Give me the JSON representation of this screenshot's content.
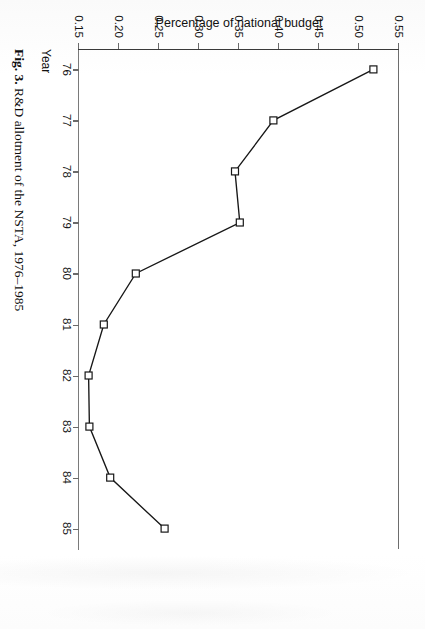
{
  "figure": {
    "caption_label": "Fig. 3.",
    "caption_text": "R&D allotment of the NSTA, 1976–1985",
    "rotation_note": "page scanned rotated 90 degrees clockwise"
  },
  "chart_data": {
    "type": "line",
    "title": "R&D allotment of the NSTA, 1976–1985",
    "xlabel": "Year",
    "ylabel": "Percentage of national budget",
    "x": [
      76,
      77,
      78,
      79,
      80,
      81,
      82,
      83,
      84,
      85
    ],
    "xtick_labels": [
      "76",
      "77",
      "78",
      "79",
      "80",
      "81",
      "82",
      "83",
      "84",
      "85"
    ],
    "values": [
      0.518,
      0.393,
      0.345,
      0.351,
      0.221,
      0.181,
      0.162,
      0.163,
      0.189,
      0.257
    ],
    "ytick_labels": [
      "0.55",
      "0.50",
      "0.45",
      "0.40",
      "0.35",
      "0.30",
      "0.25",
      "0.20",
      "0.15"
    ],
    "yticks": [
      0.55,
      0.5,
      0.45,
      0.4,
      0.35,
      0.3,
      0.25,
      0.2,
      0.15
    ],
    "xlim": [
      75.6,
      85.4
    ],
    "ylim": [
      0.15,
      0.55
    ],
    "grid": false,
    "legend": "none",
    "marker": "open-square",
    "line_color": "#171717",
    "marker_fill": "#ffffff"
  }
}
